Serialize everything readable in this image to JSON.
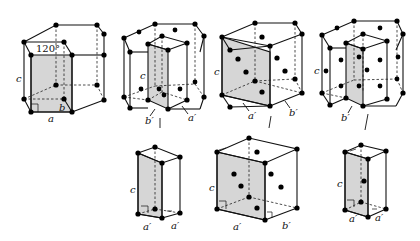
{
  "figure": {
    "top_row": [
      {
        "id": "hex-cell",
        "labels": {
          "c": "c",
          "a": "a",
          "b": "b",
          "angle": "120°"
        }
      },
      {
        "id": "hex-cell-selection-1",
        "labels": {
          "c": "c",
          "b_prime": "b′",
          "a_prime": "a′"
        }
      },
      {
        "id": "hex-cell-selection-2",
        "labels": {
          "c": "c",
          "a_prime": "a′",
          "b_prime": "b′"
        }
      },
      {
        "id": "hex-cell-selection-3",
        "labels": {
          "c": "c",
          "b_prime": "b′"
        }
      }
    ],
    "bottom_row": [
      {
        "id": "derived-cell-1",
        "labels": {
          "c": "c",
          "a_prime_1": "a′",
          "a_prime_2": "a′"
        }
      },
      {
        "id": "derived-cell-2",
        "labels": {
          "c": "c",
          "a_prime": "a′",
          "b_prime": "b′"
        }
      },
      {
        "id": "derived-cell-3",
        "labels": {
          "c": "c",
          "a_prime_1": "a′",
          "a_prime_2": "a′"
        }
      }
    ]
  }
}
